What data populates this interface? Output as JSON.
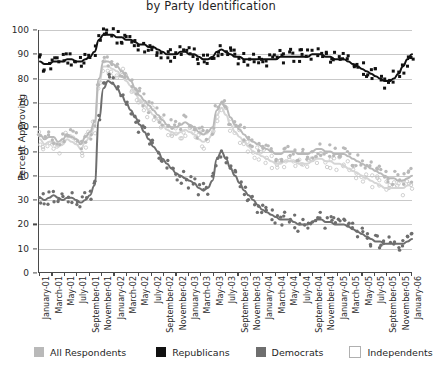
{
  "chart_data": {
    "type": "scatter",
    "title": "by Party Identification",
    "xlabel": "",
    "ylabel": "Percent Approving",
    "ylim": [
      0,
      100
    ],
    "ytick_step": 10,
    "grid": true,
    "legend_position": "bottom",
    "y_ticks": [
      "0",
      "10",
      "20",
      "30",
      "40",
      "50",
      "60",
      "70",
      "80",
      "90",
      "100"
    ],
    "x_ticks": [
      "January-01",
      "March-01",
      "May-01",
      "July-01",
      "September-01",
      "November-01",
      "January-02",
      "March-02",
      "May-02",
      "July-02",
      "September-02",
      "November-02",
      "January-03",
      "March-03",
      "May-03",
      "July-03",
      "September-03",
      "November-03",
      "January-04",
      "March-04",
      "May-04",
      "July-04",
      "September-04",
      "November-04",
      "January-05",
      "March-05",
      "May-05",
      "July-05",
      "September-05",
      "November-05",
      "January-06"
    ],
    "series": [
      {
        "name": "All Respondents",
        "color": "#b9b9b9",
        "marker": "filled-circle",
        "trend": [
          57,
          55,
          56,
          56,
          54,
          55,
          57,
          56,
          55,
          53,
          56,
          58,
          62,
          80,
          87,
          87,
          86,
          85,
          83,
          81,
          79,
          76,
          73,
          71,
          69,
          67,
          65,
          63,
          61,
          60,
          60,
          61,
          62,
          61,
          60,
          58,
          57,
          58,
          60,
          67,
          70,
          68,
          64,
          61,
          59,
          57,
          55,
          54,
          53,
          52,
          51,
          50,
          49,
          49,
          50,
          50,
          50,
          49,
          49,
          49,
          50,
          51,
          51,
          50,
          50,
          49,
          49,
          49,
          48,
          47,
          46,
          45,
          44,
          43,
          42,
          41,
          40,
          39,
          39,
          38,
          38,
          39,
          40
        ]
      },
      {
        "name": "Republicans",
        "color": "#111111",
        "marker": "filled-square",
        "trend": [
          87,
          86,
          86,
          87,
          87,
          87,
          88,
          88,
          87,
          87,
          88,
          89,
          91,
          96,
          98,
          98,
          98,
          97,
          97,
          96,
          96,
          95,
          94,
          94,
          93,
          93,
          92,
          91,
          90,
          90,
          90,
          91,
          91,
          90,
          90,
          89,
          88,
          88,
          89,
          91,
          92,
          91,
          90,
          89,
          89,
          88,
          88,
          88,
          88,
          88,
          88,
          88,
          88,
          89,
          89,
          89,
          89,
          89,
          89,
          89,
          90,
          90,
          90,
          89,
          89,
          88,
          88,
          88,
          87,
          86,
          85,
          84,
          83,
          82,
          81,
          80,
          79,
          79,
          80,
          82,
          85,
          88,
          90
        ]
      },
      {
        "name": "Democrats",
        "color": "#6e6e6e",
        "marker": "filled-circle",
        "trend": [
          31,
          30,
          31,
          32,
          31,
          30,
          31,
          31,
          30,
          29,
          30,
          32,
          36,
          63,
          76,
          79,
          78,
          76,
          73,
          70,
          67,
          64,
          61,
          58,
          55,
          52,
          50,
          47,
          45,
          43,
          41,
          40,
          39,
          38,
          37,
          35,
          34,
          35,
          38,
          47,
          50,
          47,
          43,
          40,
          37,
          34,
          32,
          30,
          28,
          26,
          25,
          24,
          23,
          22,
          22,
          22,
          21,
          20,
          20,
          20,
          21,
          22,
          22,
          21,
          21,
          20,
          20,
          20,
          19,
          18,
          17,
          16,
          15,
          14,
          13,
          13,
          12,
          12,
          12,
          12,
          12,
          13,
          14
        ]
      },
      {
        "name": "Independents",
        "color": "#f2f2f2",
        "marker": "open-circle",
        "trend": [
          55,
          53,
          54,
          54,
          52,
          53,
          55,
          54,
          53,
          51,
          54,
          56,
          60,
          78,
          85,
          85,
          84,
          83,
          81,
          79,
          77,
          74,
          71,
          69,
          67,
          65,
          63,
          61,
          59,
          58,
          57,
          58,
          59,
          58,
          57,
          55,
          54,
          55,
          57,
          65,
          68,
          65,
          61,
          58,
          56,
          54,
          52,
          50,
          49,
          48,
          47,
          46,
          45,
          45,
          46,
          46,
          46,
          45,
          45,
          45,
          46,
          47,
          47,
          46,
          46,
          45,
          45,
          44,
          43,
          42,
          41,
          40,
          39,
          38,
          37,
          36,
          35,
          35,
          35,
          35,
          35,
          36,
          37
        ]
      }
    ]
  },
  "legend": {
    "items": [
      {
        "label": "All Respondents",
        "color": "#b9b9b9",
        "style": "filled"
      },
      {
        "label": "Republicans",
        "color": "#111111",
        "style": "filled"
      },
      {
        "label": "Democrats",
        "color": "#6e6e6e",
        "style": "filled"
      },
      {
        "label": "Independents",
        "color": "#ffffff",
        "style": "outline"
      }
    ]
  },
  "axis": {
    "y_title": "Percent Approving"
  }
}
